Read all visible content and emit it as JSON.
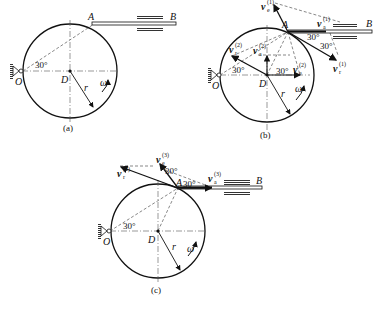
{
  "figure": {
    "panels": [
      {
        "caption": "(a)",
        "labels": {
          "A": "A",
          "B": "B",
          "O": "O",
          "D": "D",
          "r": "r",
          "omega": "ω",
          "angle": "30°"
        }
      },
      {
        "caption": "(b)",
        "labels": {
          "A": "A",
          "B": "B",
          "O": "O",
          "D": "D",
          "r": "r",
          "omega": "ω",
          "angle_O": "30°",
          "angle_A1": "30°",
          "angle_A2": "30°",
          "angle_D": "30°"
        },
        "vectors": {
          "ve1": {
            "base": "v",
            "sub": "e",
            "sup": "(1)"
          },
          "va1": {
            "base": "v",
            "sub": "a",
            "sup": "(1)"
          },
          "vr1": {
            "base": "v",
            "sub": "r",
            "sup": "(1)"
          },
          "vr2": {
            "base": "v",
            "sub": "r",
            "sup": "(2)"
          },
          "va2": {
            "base": "v",
            "sub": "a",
            "sup": "(2)"
          },
          "ve2": {
            "base": "v",
            "sub": "e",
            "sup": "(2)"
          }
        }
      },
      {
        "caption": "(c)",
        "labels": {
          "A": "A",
          "B": "B",
          "O": "O",
          "D": "D",
          "r": "r",
          "omega": "ω",
          "angle_O": "30°",
          "angle_A1": "30°",
          "angle_A2": "30°"
        },
        "vectors": {
          "vr3": {
            "base": "v",
            "sub": "r",
            "sup": "(3)"
          },
          "ve3": {
            "base": "v",
            "sub": "e",
            "sup": "(3)"
          },
          "va3": {
            "base": "v",
            "sub": "a",
            "sup": "(3)"
          }
        }
      }
    ]
  }
}
